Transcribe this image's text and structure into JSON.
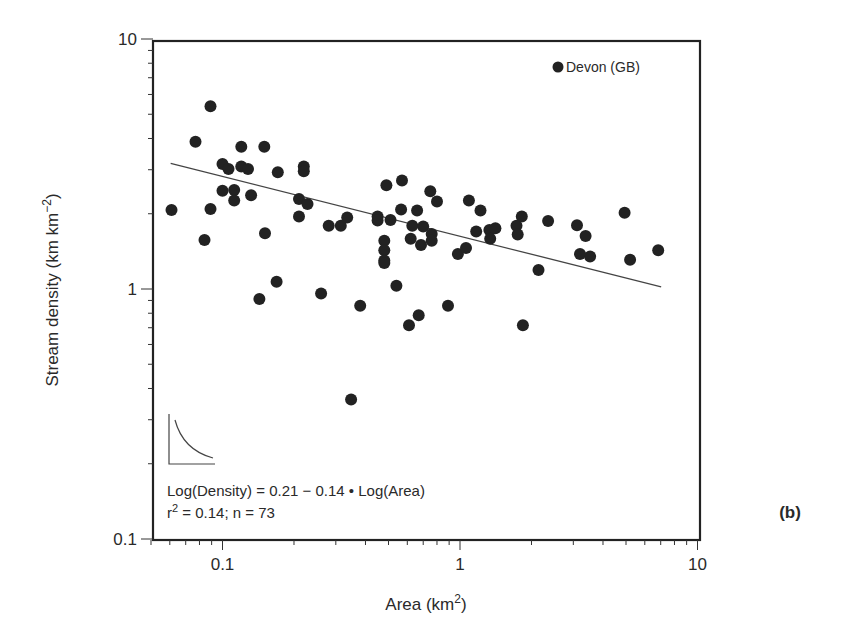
{
  "chart_data": {
    "type": "scatter",
    "title": "",
    "panel_label": "(b)",
    "xlabel": "Area (km",
    "xlabel_sup": "2",
    "xlabel_end": ")",
    "ylabel": "Stream density (km km",
    "ylabel_sup": "−2",
    "ylabel_end": ")",
    "xscale": "log",
    "yscale": "log",
    "xlim": [
      0.049,
      10
    ],
    "ylim": [
      0.1,
      10
    ],
    "xticks": [
      0.1,
      1,
      10
    ],
    "xtick_labels": [
      "0.1",
      "1",
      "10"
    ],
    "yticks": [
      0.1,
      1,
      10
    ],
    "ytick_labels": [
      "0.1",
      "1",
      "10"
    ],
    "grid": false,
    "legend": {
      "position": "top-right",
      "entries": [
        "Devon (GB)"
      ]
    },
    "series": [
      {
        "name": "Devon (GB)",
        "marker": "filled-circle",
        "color": "#222222",
        "points": [
          [
            0.061,
            2.07
          ],
          [
            0.077,
            3.88
          ],
          [
            0.084,
            1.57
          ],
          [
            0.089,
            5.38
          ],
          [
            0.089,
            2.09
          ],
          [
            0.1,
            3.16
          ],
          [
            0.1,
            2.47
          ],
          [
            0.106,
            3.02
          ],
          [
            0.112,
            2.49
          ],
          [
            0.112,
            2.26
          ],
          [
            0.12,
            3.71
          ],
          [
            0.12,
            3.09
          ],
          [
            0.128,
            3.02
          ],
          [
            0.132,
            2.37
          ],
          [
            0.143,
            0.912
          ],
          [
            0.15,
            3.71
          ],
          [
            0.151,
            1.67
          ],
          [
            0.169,
            1.07
          ],
          [
            0.171,
            2.93
          ],
          [
            0.21,
            2.29
          ],
          [
            0.21,
            1.95
          ],
          [
            0.22,
            3.09
          ],
          [
            0.22,
            2.96
          ],
          [
            0.228,
            2.19
          ],
          [
            0.26,
            0.96
          ],
          [
            0.28,
            1.79
          ],
          [
            0.315,
            1.79
          ],
          [
            0.335,
            1.93
          ],
          [
            0.348,
            0.361
          ],
          [
            0.38,
            0.857
          ],
          [
            0.45,
            1.95
          ],
          [
            0.45,
            1.88
          ],
          [
            0.48,
            1.56
          ],
          [
            0.48,
            1.43
          ],
          [
            0.48,
            1.3
          ],
          [
            0.48,
            1.27
          ],
          [
            0.49,
            2.6
          ],
          [
            0.51,
            1.89
          ],
          [
            0.54,
            1.03
          ],
          [
            0.565,
            2.08
          ],
          [
            0.57,
            2.72
          ],
          [
            0.61,
            0.716
          ],
          [
            0.62,
            1.59
          ],
          [
            0.63,
            1.79
          ],
          [
            0.66,
            2.06
          ],
          [
            0.67,
            0.785
          ],
          [
            0.685,
            1.5
          ],
          [
            0.7,
            1.78
          ],
          [
            0.75,
            2.46
          ],
          [
            0.76,
            1.66
          ],
          [
            0.76,
            1.56
          ],
          [
            0.8,
            2.24
          ],
          [
            0.89,
            0.857
          ],
          [
            0.98,
            1.38
          ],
          [
            1.06,
            1.46
          ],
          [
            1.09,
            2.26
          ],
          [
            1.17,
            1.7
          ],
          [
            1.22,
            2.06
          ],
          [
            1.33,
            1.72
          ],
          [
            1.34,
            1.59
          ],
          [
            1.41,
            1.75
          ],
          [
            1.73,
            1.79
          ],
          [
            1.75,
            1.65
          ],
          [
            1.82,
            1.95
          ],
          [
            1.84,
            0.716
          ],
          [
            2.14,
            1.19
          ],
          [
            2.35,
            1.87
          ],
          [
            3.11,
            1.8
          ],
          [
            3.2,
            1.38
          ],
          [
            3.38,
            1.63
          ],
          [
            3.53,
            1.35
          ],
          [
            4.93,
            2.02
          ],
          [
            5.2,
            1.31
          ],
          [
            6.83,
            1.43
          ]
        ]
      }
    ],
    "regression_line": {
      "from": [
        0.0605,
        3.18
      ],
      "to": [
        7.03,
        1.02
      ],
      "equation": "Log(Density) = 0.21 − 0.14 • Log(Area)",
      "r2_prefix": "r",
      "r2_sup": "2",
      "r2_rest": " = 0.14; n = 73"
    },
    "annotations": [
      "Log(Density) = 0.21 − 0.14 • Log(Area)",
      "r² = 0.14; n = 73"
    ]
  },
  "layout": {
    "plot_left": 153,
    "plot_right": 700,
    "plot_top": 41,
    "plot_bottom": 540,
    "x_px_per_decade": 237.5,
    "x_px_at_1": 460,
    "y_px_per_decade": 250,
    "y_px_at_1": 289,
    "marker_radius": 6
  }
}
